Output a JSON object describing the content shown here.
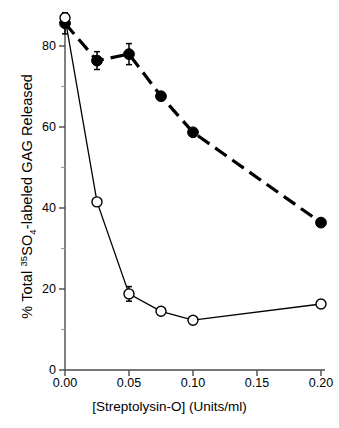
{
  "chart_data": {
    "type": "line",
    "title": "",
    "xlabel": "[Streptolysin-O]  (Units/ml)",
    "ylabel_parts": {
      "pre": "% Total ",
      "sup": "35",
      "mid": "SO",
      "sub": "4",
      "post": "-labeled GAG Released"
    },
    "ylabel": "% Total 35SO4-labeled GAG Released",
    "xlim": [
      0.0,
      0.2
    ],
    "ylim": [
      0,
      90
    ],
    "xticks": [
      0.0,
      0.05,
      0.1,
      0.15,
      0.2
    ],
    "xtick_labels": [
      "0.00",
      "0.05",
      "0.10",
      "0.15",
      "0.20"
    ],
    "yticks": [
      0,
      20,
      40,
      60,
      80
    ],
    "ytick_labels": [
      "0",
      "20",
      "40",
      "60",
      "80"
    ],
    "yminor_ticks": [
      10,
      30,
      50,
      70
    ],
    "grid": false,
    "legend": "none",
    "series": [
      {
        "name": "filled-circles",
        "marker": "filled-circle",
        "linestyle": "dashed",
        "color": "#000000",
        "x": [
          0.0,
          0.025,
          0.05,
          0.075,
          0.1,
          0.2
        ],
        "values": [
          85.6,
          76.4,
          78.0,
          67.6,
          58.7,
          36.4
        ],
        "errors": [
          2.6,
          2.2,
          2.6,
          0.0,
          0.0,
          0.0
        ]
      },
      {
        "name": "open-circles",
        "marker": "open-circle",
        "linestyle": "solid",
        "color": "#000000",
        "x": [
          0.0,
          0.025,
          0.05,
          0.075,
          0.1,
          0.2
        ],
        "values": [
          87.0,
          41.5,
          18.8,
          14.5,
          12.3,
          16.3
        ],
        "errors": [
          1.2,
          0.0,
          1.8,
          0.0,
          0.0,
          0.0
        ]
      }
    ]
  },
  "axis": {
    "ytick_0": "0",
    "ytick_20": "20",
    "ytick_40": "40",
    "ytick_60": "60",
    "ytick_80": "80",
    "xtick_000": "0.00",
    "xtick_005": "0.05",
    "xtick_010": "0.10",
    "xtick_015": "0.15",
    "xtick_020": "0.20"
  },
  "labels": {
    "y_pre": "% Total ",
    "y_sup": "35",
    "y_mid": "SO",
    "y_sub": "4",
    "y_post": "-labeled GAG Released",
    "x_axis": "[Streptolysin-O]  (Units/ml)"
  }
}
